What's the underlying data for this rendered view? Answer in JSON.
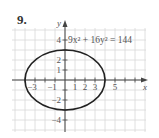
{
  "problem_number": "9.",
  "equation_label": "9x² + 16y² = 144",
  "colors": {
    "grid": "#d8d8d8",
    "axis": "#444444",
    "curve": "#222222",
    "text": "#555555"
  },
  "chart_data": {
    "type": "line",
    "title": "9x² + 16y² = 144",
    "xlabel": "x",
    "ylabel": "y",
    "xlim": [
      -5,
      7
    ],
    "ylim": [
      -5,
      5
    ],
    "grid": true,
    "x_tick_labels": [
      "−3",
      "−1",
      "1",
      "2",
      "3",
      "5"
    ],
    "x_ticks": [
      -3,
      -1,
      1,
      2,
      3,
      5
    ],
    "y_tick_labels": [
      "4",
      "2",
      "1",
      "−2",
      "−4"
    ],
    "y_ticks": [
      4,
      2,
      1,
      -2,
      -4
    ],
    "series": [
      {
        "name": "ellipse 9x² + 16y² = 144",
        "shape": "ellipse",
        "center": [
          0,
          0
        ],
        "semi_axis_x": 4,
        "semi_axis_y": 3
      }
    ]
  }
}
